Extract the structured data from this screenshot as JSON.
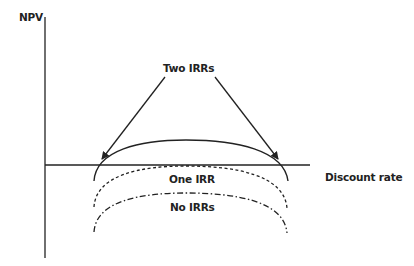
{
  "diagram": {
    "axes": {
      "y_label": "NPV",
      "x_label": "Discount rate"
    },
    "annotations": {
      "two_irrs": "Two IRRs",
      "one_irr": "One IRR",
      "no_irrs": "No IRRs"
    },
    "curves": [
      {
        "name": "two-irrs-curve",
        "style": "solid",
        "crosses_axis": 2
      },
      {
        "name": "one-irr-curve",
        "style": "dashed",
        "crosses_axis": 1
      },
      {
        "name": "no-irrs-curve",
        "style": "dash-dot",
        "crosses_axis": 0
      }
    ],
    "colors": {
      "line": "#222222",
      "background": "#ffffff"
    }
  }
}
